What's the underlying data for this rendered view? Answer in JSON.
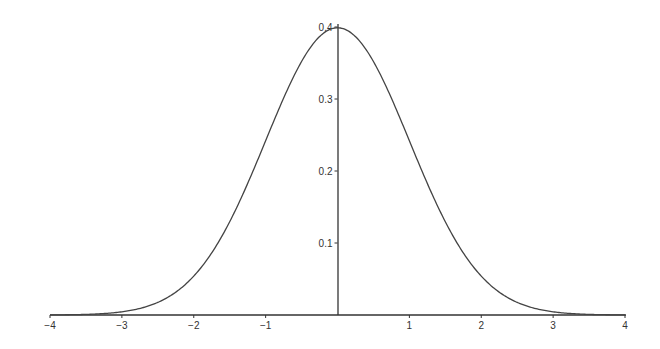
{
  "chart_data": {
    "type": "line",
    "title": "",
    "xlabel": "",
    "ylabel": "",
    "xlim": [
      -4,
      4
    ],
    "ylim": [
      0,
      0.4
    ],
    "grid": false,
    "legend": null,
    "x_ticks": [
      "-4",
      "-3",
      "-2",
      "-1",
      "1",
      "2",
      "3",
      "4"
    ],
    "y_ticks": [
      "0.1",
      "0.2",
      "0.3",
      "0.4"
    ],
    "series": [
      {
        "name": "normal pdf",
        "x": [
          -4,
          -3.5,
          -3,
          -2.5,
          -2,
          -1.5,
          -1,
          -0.5,
          0,
          0.5,
          1,
          1.5,
          2,
          2.5,
          3,
          3.5,
          4
        ],
        "y": [
          0.0001,
          0.0009,
          0.0044,
          0.0175,
          0.054,
          0.1295,
          0.242,
          0.3521,
          0.3989,
          0.3521,
          0.242,
          0.1295,
          0.054,
          0.0175,
          0.0044,
          0.0009,
          0.0001
        ]
      }
    ]
  }
}
